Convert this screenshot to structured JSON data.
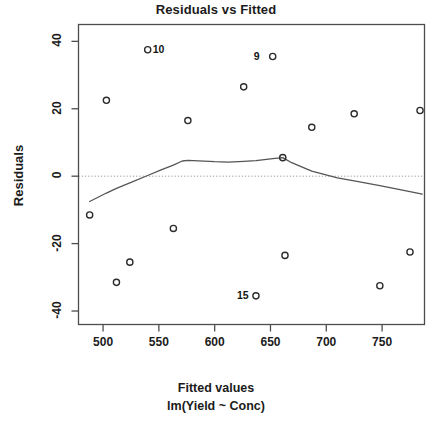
{
  "chart_data": {
    "type": "scatter",
    "title": "Residuals vs Fitted",
    "xlabel": "Fitted values",
    "sublabel": "lm(Yield ~ Conc)",
    "ylabel": "Residuals",
    "xlim": [
      478,
      788
    ],
    "ylim": [
      -44,
      45
    ],
    "grid": false,
    "legend": null,
    "xticks": [
      500,
      550,
      600,
      650,
      700,
      750
    ],
    "yticks": [
      40,
      20,
      0,
      -20,
      -40
    ],
    "zero_reference_line": 0,
    "zero_line_style": "dotted",
    "points": [
      {
        "x": 488,
        "y": -11.5,
        "label": null
      },
      {
        "x": 503,
        "y": 22.5,
        "label": null
      },
      {
        "x": 512,
        "y": -31.5,
        "label": null
      },
      {
        "x": 524,
        "y": -25.5,
        "label": null
      },
      {
        "x": 540,
        "y": 37.5,
        "label": "10"
      },
      {
        "x": 563,
        "y": -15.5,
        "label": null
      },
      {
        "x": 576,
        "y": 16.5,
        "label": null
      },
      {
        "x": 626,
        "y": 26.5,
        "label": null
      },
      {
        "x": 637,
        "y": -35.5,
        "label": "15"
      },
      {
        "x": 652,
        "y": 35.5,
        "label": "9"
      },
      {
        "x": 661,
        "y": 5.5,
        "label": null
      },
      {
        "x": 663,
        "y": -23.5,
        "label": null
      },
      {
        "x": 687,
        "y": 14.5,
        "label": null
      },
      {
        "x": 725,
        "y": 18.5,
        "label": null
      },
      {
        "x": 748,
        "y": -32.5,
        "label": null
      },
      {
        "x": 775,
        "y": -22.5,
        "label": null
      },
      {
        "x": 784,
        "y": 19.5,
        "label": null
      }
    ],
    "smooth_curve": [
      {
        "x": 488,
        "y": -7.5
      },
      {
        "x": 503,
        "y": -5.0
      },
      {
        "x": 512,
        "y": -3.6
      },
      {
        "x": 524,
        "y": -2.0
      },
      {
        "x": 540,
        "y": 0.2
      },
      {
        "x": 552,
        "y": 1.9
      },
      {
        "x": 563,
        "y": 3.3
      },
      {
        "x": 571,
        "y": 4.5
      },
      {
        "x": 576,
        "y": 4.7
      },
      {
        "x": 600,
        "y": 4.3
      },
      {
        "x": 612,
        "y": 4.2
      },
      {
        "x": 626,
        "y": 4.4
      },
      {
        "x": 637,
        "y": 4.6
      },
      {
        "x": 652,
        "y": 5.2
      },
      {
        "x": 661,
        "y": 5.5
      },
      {
        "x": 669,
        "y": 4.0
      },
      {
        "x": 687,
        "y": 1.5
      },
      {
        "x": 710,
        "y": -0.5
      },
      {
        "x": 725,
        "y": -1.4
      },
      {
        "x": 748,
        "y": -2.8
      },
      {
        "x": 775,
        "y": -4.6
      },
      {
        "x": 786,
        "y": -5.3
      }
    ],
    "point_labels": [
      {
        "text": "10",
        "x": 540,
        "y": 37.5,
        "side": "right"
      },
      {
        "text": "9",
        "x": 652,
        "y": 35.5,
        "side": "left"
      },
      {
        "text": "15",
        "x": 637,
        "y": -35.5,
        "side": "left"
      }
    ],
    "colors": {
      "frame": "#4d4d4d",
      "point": "#2b2b2b",
      "curve": "#555555",
      "zero_line": "#9a9a9a",
      "text": "#1b1b1b",
      "background": "#ffffff"
    }
  }
}
